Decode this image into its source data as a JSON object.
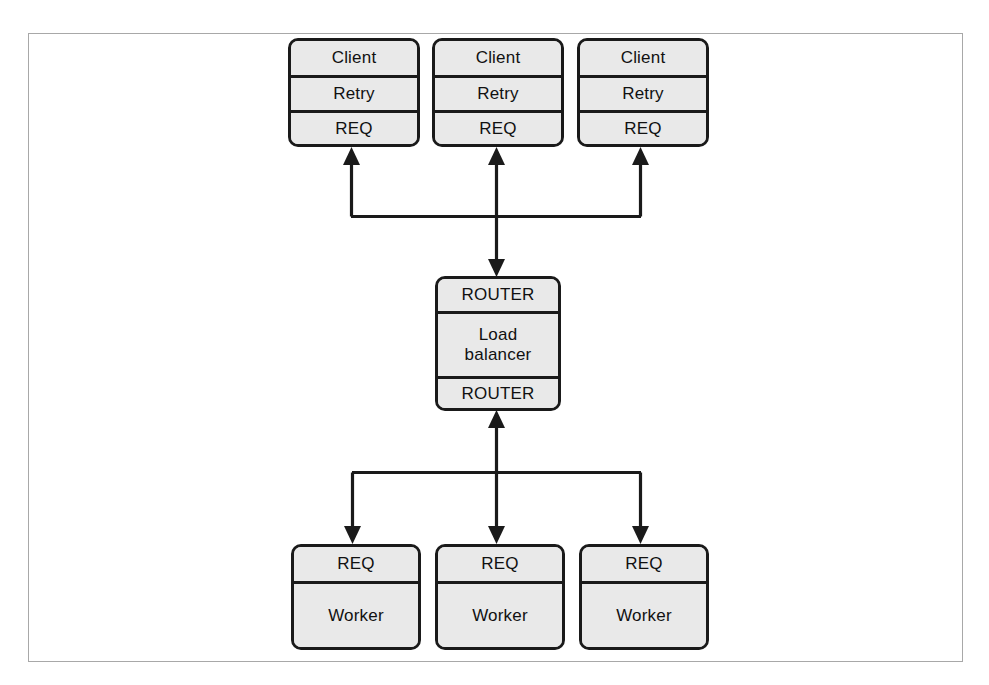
{
  "figure": {
    "kind": "diagram",
    "frame_color": "#a8a8a8",
    "box_fill": "#e9e9e9",
    "line_color": "#1a1a1a"
  },
  "clients": [
    {
      "role_label": "Client",
      "pattern_label": "Retry",
      "socket_label": "REQ"
    },
    {
      "role_label": "Client",
      "pattern_label": "Retry",
      "socket_label": "REQ"
    },
    {
      "role_label": "Client",
      "pattern_label": "Retry",
      "socket_label": "REQ"
    }
  ],
  "broker": {
    "socket_in_label": "ROUTER",
    "role_label": "Load\nbalancer",
    "socket_out_label": "ROUTER"
  },
  "workers": [
    {
      "socket_label": "REQ",
      "role_label": "Worker"
    },
    {
      "socket_label": "REQ",
      "role_label": "Worker"
    },
    {
      "socket_label": "REQ",
      "role_label": "Worker"
    }
  ],
  "connectors": {
    "client_bus_label": "client bus",
    "worker_bus_label": "worker bus",
    "upper_link_label": "clients-to-router link",
    "lower_link_label": "router-to-workers link"
  }
}
